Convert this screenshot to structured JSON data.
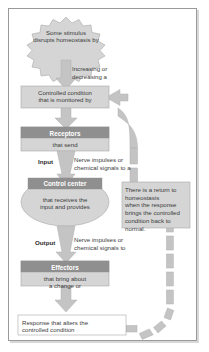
{
  "diagram": {
    "colors": {
      "shape_fill": "#d5d5d5",
      "shape_stroke": "#a8a8a8",
      "header_fill": "#8f8f8f",
      "arrow_fill": "#c4c4c4",
      "arrow_stroke": "#adadad",
      "frame_stroke": "#9a9a9a",
      "text": "#3b3b3b",
      "header_text": "#ffffff",
      "page_background": "#ffffff"
    },
    "nodes": {
      "stimulus": {
        "shape": "starburst",
        "line1": "Some stimulus",
        "line2": "disrupts homeostasis by"
      },
      "increasing_decreasing": {
        "shape": "text",
        "line1": "Increasing or",
        "line2": "decreasing a"
      },
      "controlled_condition": {
        "shape": "rectangle",
        "line1": "Controlled condition",
        "line2": "that is monitored by"
      },
      "receptors": {
        "shape": "rectangle-with-header",
        "header": "Receptors",
        "body": "that send"
      },
      "input": {
        "label": "Input",
        "line1": "Nerve impulses or",
        "line2": "chemical signals to a"
      },
      "control_center": {
        "shape": "ellipse-with-header",
        "header": "Control center",
        "body_line1": "that receives the",
        "body_line2": "input and provides"
      },
      "output": {
        "label": "Output",
        "line1": "Nerve impulses or",
        "line2": "chemical signals to"
      },
      "effectors": {
        "shape": "rectangle-with-header",
        "header": "Effectors",
        "body_line1": "that bring about",
        "body_line2": "a change or"
      },
      "response": {
        "shape": "rectangle",
        "line1": "Response that alters the",
        "line2": "controlled condition"
      },
      "return_note": {
        "shape": "note-rectangle",
        "line1": "There is a return to",
        "line2": "homeostasis",
        "line3": "when the response",
        "line4": "brings the controlled",
        "line5": "condition back to",
        "line6": "normal."
      }
    },
    "connectors": {
      "stimulus_to_condition": "block-arrow-down",
      "condition_to_receptors": "block-arrow-down",
      "receptors_to_control_center": "block-arrow-down",
      "control_center_to_effectors": "block-arrow-down",
      "effectors_to_response": "block-arrow-down",
      "feedback_loop": "dashed-block-arrow-curved-return-to-controlled-condition"
    }
  }
}
